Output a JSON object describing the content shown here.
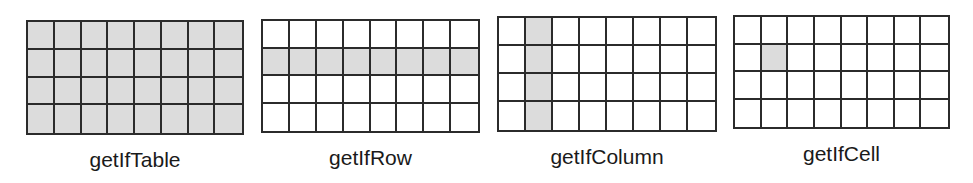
{
  "colors": {
    "grid_line": "#2b2b2b",
    "highlight_fill": "#dcdcdc",
    "cell_fill": "#ffffff",
    "label_text": "#1a1a1a"
  },
  "grid_dims": {
    "rows": 4,
    "columns": 8
  },
  "panels": [
    {
      "label": "getIfTable",
      "highlight": "all",
      "highlighted_cells": "all 32 cells"
    },
    {
      "label": "getIfRow",
      "highlight": "row",
      "highlighted_row": 2
    },
    {
      "label": "getIfColumn",
      "highlight": "column",
      "highlighted_column": 2
    },
    {
      "label": "getIfCell",
      "highlight": "cell",
      "highlighted_cell": {
        "row": 2,
        "column": 2
      }
    }
  ]
}
